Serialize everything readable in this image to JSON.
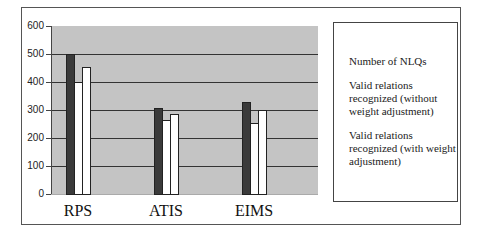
{
  "chart_data": {
    "type": "bar",
    "title": "",
    "xlabel": "",
    "ylabel": "",
    "categories": [
      "RPS",
      "ATIS",
      "EIMS"
    ],
    "series": [
      {
        "name": "Number of NLQs",
        "values": [
          500,
          307,
          329
        ],
        "color": "#3a3a3a"
      },
      {
        "name": "Valid relations recognized (without weight adjustment)",
        "values": [
          400,
          264,
          254
        ],
        "color": "#ffffff"
      },
      {
        "name": "Valid relations recognized (with weight adjustment)",
        "values": [
          455,
          286,
          300
        ],
        "color": "#ffffff"
      }
    ],
    "ylim": [
      0,
      600
    ],
    "yticks": [
      0,
      100,
      200,
      300,
      400,
      500,
      600
    ],
    "grid": true,
    "legend_position": "right",
    "plot_background": "#c4c4c4"
  },
  "axis": {
    "yticks": [
      "0",
      "100",
      "200",
      "300",
      "400",
      "500",
      "600"
    ]
  },
  "legend": {
    "items": [
      "Number of NLQs",
      "Valid relations recognized (without weight adjustment)",
      "Valid relations recognized (with weight adjustment)"
    ]
  }
}
